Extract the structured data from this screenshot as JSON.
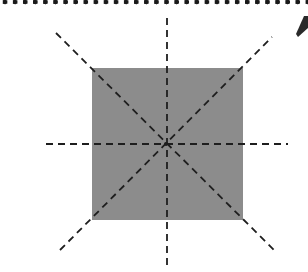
{
  "figure": {
    "canvas": {
      "width": 308,
      "height": 272
    },
    "colors": {
      "background": "#ffffff",
      "square_fill": "#8c8c8c",
      "line": "#1e1e1e",
      "border_dots": "#1a1a1a"
    },
    "square": {
      "x": 92,
      "y": 68,
      "width": 151,
      "height": 152
    },
    "center": {
      "x": 166,
      "y": 144
    },
    "symmetry_lines": [
      {
        "name": "horizontal",
        "x1": 46,
        "y1": 144,
        "x2": 288,
        "y2": 144
      },
      {
        "name": "vertical",
        "x1": 167,
        "y1": 18,
        "x2": 167,
        "y2": 266
      },
      {
        "name": "diagonal-main",
        "x1": 56,
        "y1": 33,
        "x2": 276,
        "y2": 252
      },
      {
        "name": "diagonal-anti",
        "x1": 60,
        "y1": 250,
        "x2": 272,
        "y2": 37
      }
    ],
    "dash_pattern": "7 5"
  }
}
